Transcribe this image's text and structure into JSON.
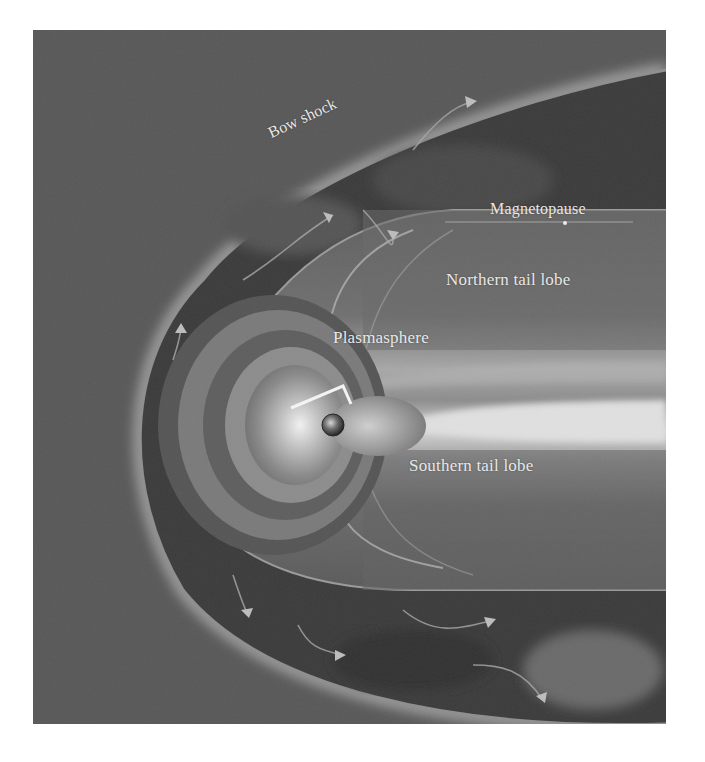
{
  "figure": {
    "labels": {
      "bow_shock": "Bow shock",
      "magnetopause": "Magnetopause",
      "northern_tail_lobe": "Northern tail lobe",
      "plasmasphere": "Plasmasphere",
      "southern_tail_lobe": "Southern tail lobe"
    },
    "colors": {
      "solar_wind": "#585858",
      "magnetosheath": "#3a3a3a",
      "bow_shock_edge": "#9a9a9a",
      "tail_lobe": "#707070",
      "plasma_sheet": "#cfcfcf",
      "plasmasphere_core": "#e6e6e6",
      "label_text": "#e8e8e8"
    },
    "icons": {
      "earth": "earth-globe-icon",
      "flow_arrows": "flow-arrow-icon"
    }
  }
}
